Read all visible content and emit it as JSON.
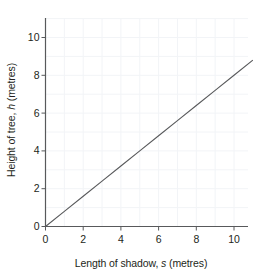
{
  "chart_data": {
    "type": "line",
    "title": "",
    "subtitle": "",
    "xlabel": "Length of shadow, s (metres)",
    "xlabel_parts": {
      "pre": "Length of shadow, ",
      "variable": "s",
      "post": " (metres)"
    },
    "ylabel": "Height of tree, h (metres)",
    "ylabel_parts": {
      "pre": "Height of tree, ",
      "variable": "h",
      "post": " (metres)"
    },
    "xlim": [
      0,
      11.1
    ],
    "ylim": [
      0,
      11.1
    ],
    "xticks": [
      0,
      2,
      4,
      6,
      8,
      10
    ],
    "yticks": [
      0,
      2,
      4,
      6,
      8,
      10
    ],
    "xtick_labels": [
      "0",
      "2",
      "4",
      "6",
      "8",
      "10"
    ],
    "ytick_labels": [
      "0",
      "2",
      "4",
      "6",
      "8",
      "10"
    ],
    "grid": true,
    "grid_interval": 1,
    "legend": "none",
    "series": [
      {
        "name": "height vs shadow length",
        "relationship": "h = 0.8 s",
        "slope": 0.8,
        "intercept": 0,
        "x": [
          0,
          1,
          2,
          3,
          4,
          5,
          6,
          7,
          8,
          9,
          10,
          11
        ],
        "values": [
          0,
          0.8,
          1.6,
          2.4,
          3.2,
          4.0,
          4.8,
          5.6,
          6.4,
          7.2,
          8.0,
          8.8
        ],
        "line_start": [
          0,
          0
        ],
        "line_end": [
          11,
          8.8
        ]
      }
    ]
  },
  "colors": {
    "background": "#ffffff",
    "axis": "#58595b",
    "grid": "#f2f4f7",
    "line": "#58595b",
    "text": "#231f20"
  }
}
